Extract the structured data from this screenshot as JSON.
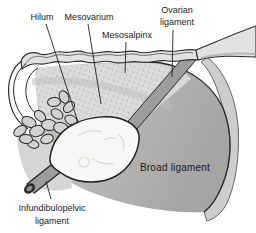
{
  "figure": {
    "type": "anatomical-diagram",
    "labels": {
      "hilum": "Hilum",
      "mesovarium": "Mesovarium",
      "mesosalpinx": "Mesosalpinx",
      "ovarian_ligament": {
        "line1": "Ovarian",
        "line2": "ligament"
      },
      "broad_ligament": "Broad ligament",
      "infundibulopelvic_ligament": {
        "line1": "Infundibulopelvic",
        "line2": "ligament"
      }
    },
    "colors": {
      "background": "#ffffff",
      "outline": "#2b2b29",
      "text": "#1a1a1a",
      "broad_ligament_light": "#c6c5c3",
      "broad_ligament_dark": "#a6a5a3",
      "outer_fold": "#cecdcb",
      "mesosalpinx_fill": "#dcdbd9",
      "stipple": "#b1b0ae",
      "tube_fill": "#e2e1df",
      "ovary_fill": "#f8f7f5",
      "rod_fill": "#9e9d9b",
      "fimbriae_fill": "#d3d2d0",
      "wedge_fill": "#d6d5d3",
      "leader_line": "#1f1f1f"
    }
  }
}
